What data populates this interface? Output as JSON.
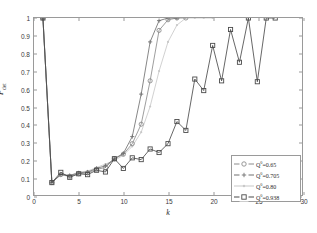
{
  "chart_data": {
    "type": "line",
    "title": "",
    "xlabel": "k",
    "ylabel": "P",
    "ylabel_sub": "det",
    "xlim": [
      0,
      30
    ],
    "ylim": [
      0,
      1
    ],
    "xticks": [
      0,
      5,
      10,
      15,
      20,
      25,
      30
    ],
    "yticks": [
      0,
      0.1,
      0.2,
      0.3,
      0.4,
      0.5,
      0.6,
      0.7,
      0.8,
      0.9,
      1
    ],
    "ytick_labels": [
      "0",
      "0.1",
      "0.2",
      "0.3",
      "0.4",
      "0.5",
      "0.6",
      "0.7",
      "0.8",
      "0.9",
      "1"
    ],
    "xtick_labels": [
      "0",
      "5",
      "10",
      "15",
      "20",
      "25",
      "30"
    ],
    "grid": false,
    "legend_position": "lower right",
    "series": [
      {
        "name": "Q°=0.65",
        "legend_label_base": "Q",
        "legend_label_sup": "0",
        "legend_label_tail": "=0.65",
        "color": "#8c8c8c",
        "marker": "circle",
        "x": [
          1,
          2,
          3,
          4,
          5,
          6,
          7,
          8,
          9,
          10,
          11,
          12,
          13,
          14,
          15,
          16,
          17
        ],
        "y": [
          1.0,
          0.07,
          0.115,
          0.105,
          0.12,
          0.125,
          0.145,
          0.155,
          0.205,
          0.23,
          0.29,
          0.4,
          0.645,
          0.93,
          0.99,
          1.0,
          1.0
        ]
      },
      {
        "name": "Q°=0.705",
        "legend_label_base": "Q",
        "legend_label_sup": "0",
        "legend_label_tail": "=0.705",
        "color": "#707070",
        "marker": "plus",
        "x": [
          1,
          2,
          3,
          4,
          5,
          6,
          7,
          8,
          9,
          10,
          11,
          12,
          13,
          14,
          15,
          16
        ],
        "y": [
          1.0,
          0.07,
          0.115,
          0.11,
          0.125,
          0.13,
          0.15,
          0.165,
          0.205,
          0.235,
          0.33,
          0.57,
          0.865,
          0.985,
          1.0,
          1.0
        ]
      },
      {
        "name": "Q°=0.80",
        "legend_label_base": "Q",
        "legend_label_sup": "0",
        "legend_label_tail": "=0.80",
        "color": "#c8c8c8",
        "marker": "dot",
        "x": [
          1,
          2,
          3,
          4,
          5,
          6,
          7,
          8,
          9,
          10,
          11,
          12,
          13,
          14,
          15,
          16,
          17,
          18,
          19,
          20
        ],
        "y": [
          1.0,
          0.07,
          0.12,
          0.11,
          0.13,
          0.135,
          0.155,
          0.175,
          0.195,
          0.225,
          0.275,
          0.355,
          0.5,
          0.7,
          0.865,
          0.96,
          1.0,
          1.0,
          1.0,
          1.0
        ]
      },
      {
        "name": "Q°=0.938",
        "legend_label_base": "Q",
        "legend_label_sup": "0",
        "legend_label_tail": "=0.938",
        "color": "#4a4a4a",
        "marker": "square",
        "x": [
          1,
          2,
          3,
          4,
          5,
          6,
          7,
          8,
          9,
          10,
          11,
          12,
          13,
          14,
          15,
          16,
          17,
          18,
          19,
          20,
          21,
          22,
          23,
          24,
          25,
          26,
          27
        ],
        "y": [
          1.0,
          0.07,
          0.128,
          0.1,
          0.12,
          0.115,
          0.14,
          0.13,
          0.205,
          0.15,
          0.21,
          0.2,
          0.26,
          0.24,
          0.29,
          0.415,
          0.365,
          0.655,
          0.59,
          0.845,
          0.645,
          0.935,
          0.75,
          1.0,
          0.64,
          1.0,
          1.0
        ]
      }
    ]
  },
  "axis": {
    "x_title": "k",
    "y_title": "P",
    "y_title_sub": "det"
  }
}
